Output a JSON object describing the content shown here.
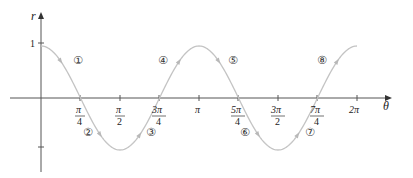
{
  "chart_data": {
    "type": "line",
    "title": "",
    "function": "r = cos(2θ)",
    "xlabel": "θ",
    "ylabel": "r",
    "xlim": [
      0,
      6.2832
    ],
    "ylim": [
      -1,
      1
    ],
    "grid": false,
    "x_ticks": [
      {
        "value": 0.7854,
        "num": "π",
        "den": "4"
      },
      {
        "value": 1.5708,
        "num": "π",
        "den": "2"
      },
      {
        "value": 2.3562,
        "num": "3π",
        "den": "4"
      },
      {
        "value": 3.1416,
        "label": "π"
      },
      {
        "value": 3.927,
        "num": "5π",
        "den": "4"
      },
      {
        "value": 4.7124,
        "num": "3π",
        "den": "2"
      },
      {
        "value": 5.4978,
        "num": "7π",
        "den": "4"
      },
      {
        "value": 6.2832,
        "label": "2π"
      }
    ],
    "y_ticks": [
      {
        "value": 1,
        "label": "1"
      },
      {
        "value": -1,
        "label": ""
      }
    ],
    "series": [
      {
        "name": "r = cos 2θ",
        "color": "#c8c8c8",
        "x": [
          0,
          0.3927,
          0.7854,
          1.1781,
          1.5708,
          1.9635,
          2.3562,
          2.7489,
          3.1416,
          3.5343,
          3.927,
          4.3197,
          4.7124,
          5.1051,
          5.4978,
          5.8905,
          6.2832
        ],
        "values": [
          1,
          0.707,
          0,
          -0.707,
          -1,
          -0.707,
          0,
          0.707,
          1,
          0.707,
          0,
          -0.707,
          -1,
          -0.707,
          0,
          0.707,
          1
        ]
      }
    ],
    "annotations": [
      {
        "text": "①",
        "x": 0.39,
        "y": 0.7
      },
      {
        "text": "②",
        "x": 1.17,
        "y": -0.65
      },
      {
        "text": "③",
        "x": 1.97,
        "y": -0.65
      },
      {
        "text": "④",
        "x": 2.33,
        "y": 0.7
      },
      {
        "text": "⑤",
        "x": 3.73,
        "y": 0.7
      },
      {
        "text": "⑥",
        "x": 3.96,
        "y": -0.65
      },
      {
        "text": "⑦",
        "x": 5.26,
        "y": -0.65
      },
      {
        "text": "⑧",
        "x": 5.5,
        "y": 0.7
      }
    ]
  },
  "labels": {
    "r_axis": "r",
    "theta_axis": "θ",
    "one": "1",
    "pi": "π",
    "two_pi": "2π",
    "segments": [
      "①",
      "②",
      "③",
      "④",
      "⑤",
      "⑥",
      "⑦",
      "⑧"
    ]
  }
}
